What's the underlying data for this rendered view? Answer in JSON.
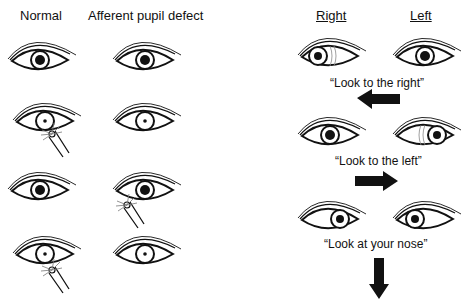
{
  "left_panel": {
    "headers": {
      "normal": "Normal",
      "apd": "Afferent pupil defect"
    },
    "rows": [
      {
        "step": 1,
        "normal": {
          "pupil": "large",
          "light": "none"
        },
        "apd": {
          "pupil": "large",
          "light": "none"
        }
      },
      {
        "step": 2,
        "normal": {
          "pupil": "small",
          "light": "right-eye"
        },
        "apd": {
          "pupil": "small",
          "light": "none"
        }
      },
      {
        "step": 3,
        "normal": {
          "pupil": "large",
          "light": "none"
        },
        "apd": {
          "pupil": "large",
          "light": "left-eye"
        }
      },
      {
        "step": 4,
        "normal": {
          "pupil": "small",
          "light": "right-eye"
        },
        "apd": {
          "pupil": "small",
          "light": "none"
        }
      }
    ]
  },
  "right_panel": {
    "headers": {
      "right": "Right",
      "left": "Left"
    },
    "steps": [
      {
        "instruction": "“Look to the right”",
        "arrow": "left-arrow"
      },
      {
        "instruction": "“Look to the left”",
        "arrow": "right-arrow"
      },
      {
        "instruction": "“Look at your nose”",
        "arrow": "down-arrow"
      }
    ]
  }
}
